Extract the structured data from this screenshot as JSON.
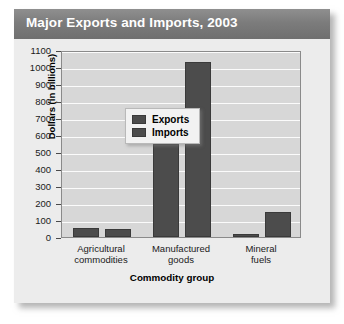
{
  "figure": {
    "title": "Major Exports and Imports, 2003"
  },
  "chart_data": {
    "type": "bar",
    "title": "Major Exports and Imports, 2003",
    "xlabel": "Commodity group",
    "ylabel": "Dollars (in billions)",
    "ylim": [
      0,
      1100
    ],
    "ytick_step": 100,
    "yticks": [
      "1100",
      "1000",
      "900",
      "800",
      "700",
      "600",
      "500",
      "400",
      "300",
      "200",
      "100",
      "0"
    ],
    "grid": true,
    "legend_position": "upper left inside plot",
    "categories": [
      "Agricultural\ncommodities",
      "Manufactured\ngoods",
      "Mineral\nfuels"
    ],
    "category_labels_flat": [
      "Agricultural commodities",
      "Manufactured goods",
      "Mineral fuels"
    ],
    "series": [
      {
        "name": "Exports",
        "color": "#4c4c4c",
        "values": [
          55,
          545,
          15
        ]
      },
      {
        "name": "Imports",
        "color": "#4c4c4c",
        "values": [
          50,
          1030,
          150
        ]
      }
    ]
  },
  "colors": {
    "bar": "#4c4c4c",
    "title_band": "#7c7c7c",
    "plot_background": "#d7d7d7",
    "gridline": "#fbfbfb",
    "card_background": "#e9e9e9"
  }
}
